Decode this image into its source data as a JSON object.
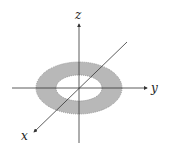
{
  "diagram": {
    "axes": {
      "x": {
        "label": "x"
      },
      "y": {
        "label": "y"
      },
      "z": {
        "label": "z"
      }
    },
    "region": {
      "shape": "annulus",
      "fill_color": "#b8b8b8",
      "border_color": "#888888",
      "border_style": "dotted"
    },
    "colors": {
      "axis": "#333333",
      "background": "#ffffff"
    }
  }
}
